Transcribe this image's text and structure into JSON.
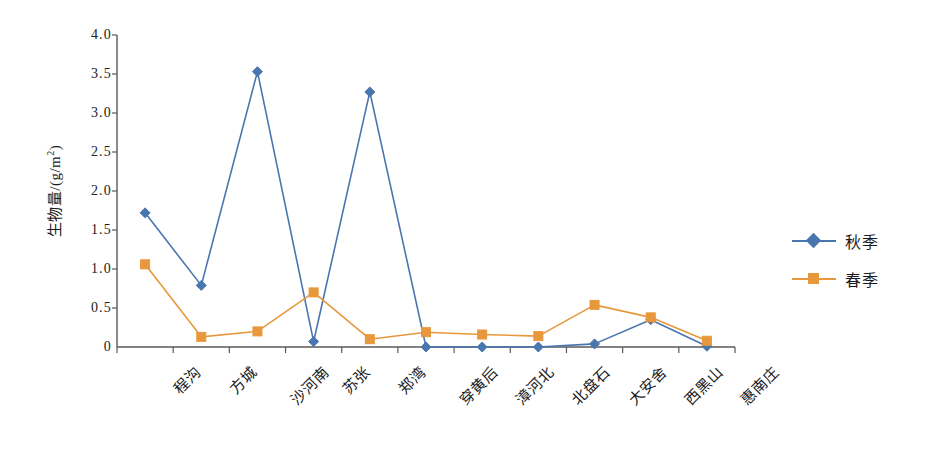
{
  "chart_data": {
    "type": "line",
    "title": "",
    "xlabel": "",
    "ylabel": "生物量/(g/m²)",
    "ylabel_main": "生物量/(g/m",
    "ylabel_sup": "2",
    "ylabel_tail": ")",
    "ylim": [
      0,
      4.0
    ],
    "ytick_interval": 0.5,
    "grid": false,
    "legend_position": "right",
    "categories": [
      "程沟",
      "方城",
      "沙河南",
      "苏张",
      "郑湾",
      "穿黄后",
      "漳河北",
      "北盘石",
      "大安舍",
      "西黑山",
      "惠南庄"
    ],
    "ytick_labels": [
      "4.0",
      "3.5",
      "3.0",
      "2.5",
      "2.0",
      "1.5",
      "1.0",
      "0.5",
      "0"
    ],
    "ytick_values": [
      4.0,
      3.5,
      3.0,
      2.5,
      2.0,
      1.5,
      1.0,
      0.5,
      0
    ],
    "series": [
      {
        "name": "秋季",
        "color": "#4A76B0",
        "marker": "diamond",
        "values": [
          1.72,
          0.79,
          3.53,
          0.07,
          3.27,
          0.0,
          0.0,
          0.0,
          0.04,
          0.35,
          0.01
        ]
      },
      {
        "name": "春季",
        "color": "#E8983C",
        "marker": "square",
        "values": [
          1.06,
          0.13,
          0.2,
          0.7,
          0.1,
          0.19,
          0.16,
          0.14,
          0.54,
          0.38,
          0.08
        ]
      }
    ]
  },
  "legend": {
    "entries": [
      {
        "label": "秋季",
        "color": "#4A76B0",
        "marker": "diamond"
      },
      {
        "label": "春季",
        "color": "#E8983C",
        "marker": "square"
      }
    ]
  },
  "axis": {
    "color": "#595959",
    "tick_color": "#595959"
  }
}
